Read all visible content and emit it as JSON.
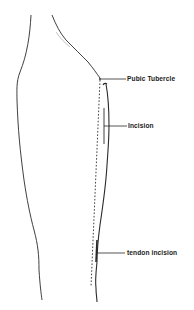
{
  "diagram": {
    "type": "anatomical line drawing",
    "labels": [
      {
        "id": "pubic-tubercle",
        "text": "Pubic Tubercle"
      },
      {
        "id": "incision",
        "text": "Incision"
      },
      {
        "id": "tendon-incision",
        "text": "tendon incision"
      }
    ],
    "colors": {
      "line": "#2a2a2a",
      "text": "#1a1a1a",
      "background": "#ffffff"
    }
  }
}
